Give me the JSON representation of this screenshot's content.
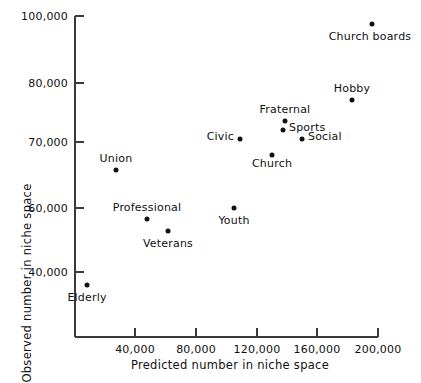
{
  "chart_data": {
    "type": "scatter",
    "title": "",
    "xlabel": "Predicted number in niche space",
    "ylabel": "Observed number in niche space",
    "xlim": [
      10000,
      205000
    ],
    "ylim": [
      30000,
      100000
    ],
    "grid": false,
    "legend": "none",
    "xticks": [
      {
        "value": 40000,
        "label": "40,000",
        "px": 135
      },
      {
        "value": 80000,
        "label": "80,000",
        "px": 196
      },
      {
        "value": 120000,
        "label": "120,000",
        "px": 257
      },
      {
        "value": 160000,
        "label": "160,000",
        "px": 317
      },
      {
        "value": 200000,
        "label": "200,000",
        "px": 378
      }
    ],
    "yticks": [
      {
        "value": 100000,
        "label": "100,000",
        "px": 16
      },
      {
        "value": 80000,
        "label": "80,000",
        "px": 83
      },
      {
        "value": 70000,
        "label": "70,000",
        "px": 142
      },
      {
        "value": 60000,
        "label": "60,000",
        "px": 208
      },
      {
        "value": 40000,
        "label": "40,000",
        "px": 272
      }
    ],
    "points": [
      {
        "label": "Church boards",
        "x": 191000,
        "y": 98800,
        "px": 372,
        "py": 24,
        "lx": 370,
        "ly": 36,
        "anchor": "center"
      },
      {
        "label": "Hobby",
        "x": 179000,
        "y": 77200,
        "px": 352,
        "py": 100,
        "lx": 352,
        "ly": 88,
        "anchor": "center"
      },
      {
        "label": "Fraternal",
        "x": 136000,
        "y": 74000,
        "px": 285,
        "py": 121,
        "lx": 285,
        "ly": 109,
        "anchor": "center"
      },
      {
        "label": "Sports",
        "x": 134000,
        "y": 72300,
        "px": 283,
        "py": 130,
        "lx": 289,
        "ly": 127,
        "anchor": "left"
      },
      {
        "label": "Social",
        "x": 147000,
        "y": 70400,
        "px": 302,
        "py": 139,
        "lx": 308,
        "ly": 136,
        "anchor": "left"
      },
      {
        "label": "Church",
        "x": 130000,
        "y": 68500,
        "px": 272,
        "py": 155,
        "lx": 272,
        "ly": 163,
        "anchor": "center"
      },
      {
        "label": "Civic",
        "x": 108000,
        "y": 70900,
        "px": 240,
        "py": 139,
        "lx": 234,
        "ly": 136,
        "anchor": "right"
      },
      {
        "label": "Union",
        "x": 34000,
        "y": 66200,
        "px": 116,
        "py": 170,
        "lx": 116,
        "ly": 158,
        "anchor": "center"
      },
      {
        "label": "Professional",
        "x": 49000,
        "y": 58200,
        "px": 147,
        "py": 219,
        "lx": 147,
        "ly": 207,
        "anchor": "center"
      },
      {
        "label": "Veterans",
        "x": 61000,
        "y": 56000,
        "px": 168,
        "py": 231,
        "lx": 168,
        "ly": 243,
        "anchor": "center"
      },
      {
        "label": "Youth",
        "x": 105000,
        "y": 59800,
        "px": 234,
        "py": 208,
        "lx": 234,
        "ly": 220,
        "anchor": "center"
      },
      {
        "label": "Elderly",
        "x": 18000,
        "y": 37600,
        "px": 87,
        "py": 285,
        "lx": 87,
        "ly": 297,
        "anchor": "center"
      }
    ]
  }
}
